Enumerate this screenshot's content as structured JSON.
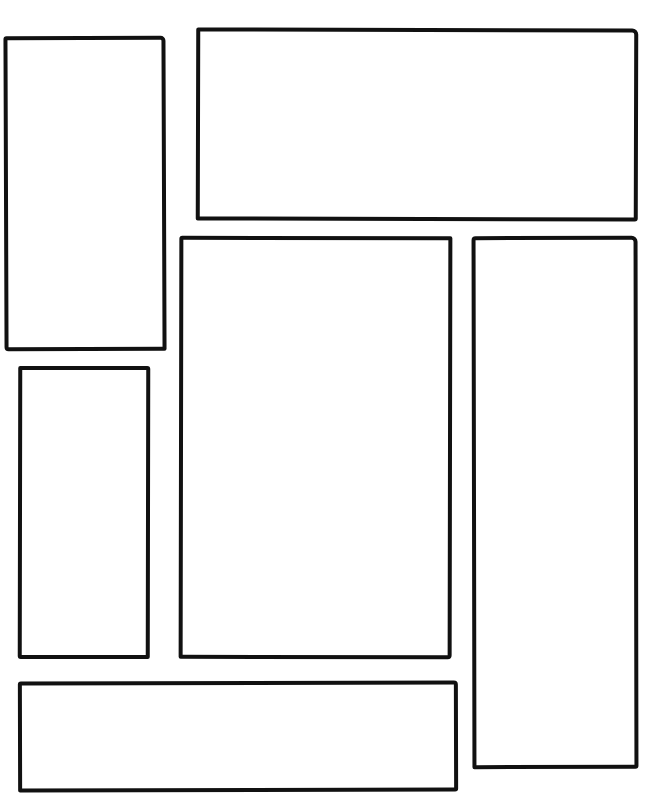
{
  "page": {
    "type": "comic-page-layout",
    "background": "#ffffff",
    "stroke_color": "#111111",
    "panel_count": 6
  },
  "panels": [
    {
      "id": "panel-1",
      "position": "top-left",
      "content": ""
    },
    {
      "id": "panel-2",
      "position": "top-right-wide",
      "content": ""
    },
    {
      "id": "panel-3",
      "position": "center-tall",
      "content": ""
    },
    {
      "id": "panel-4",
      "position": "right-tall",
      "content": ""
    },
    {
      "id": "panel-5",
      "position": "left-middle",
      "content": ""
    },
    {
      "id": "panel-6",
      "position": "bottom-wide",
      "content": ""
    }
  ]
}
